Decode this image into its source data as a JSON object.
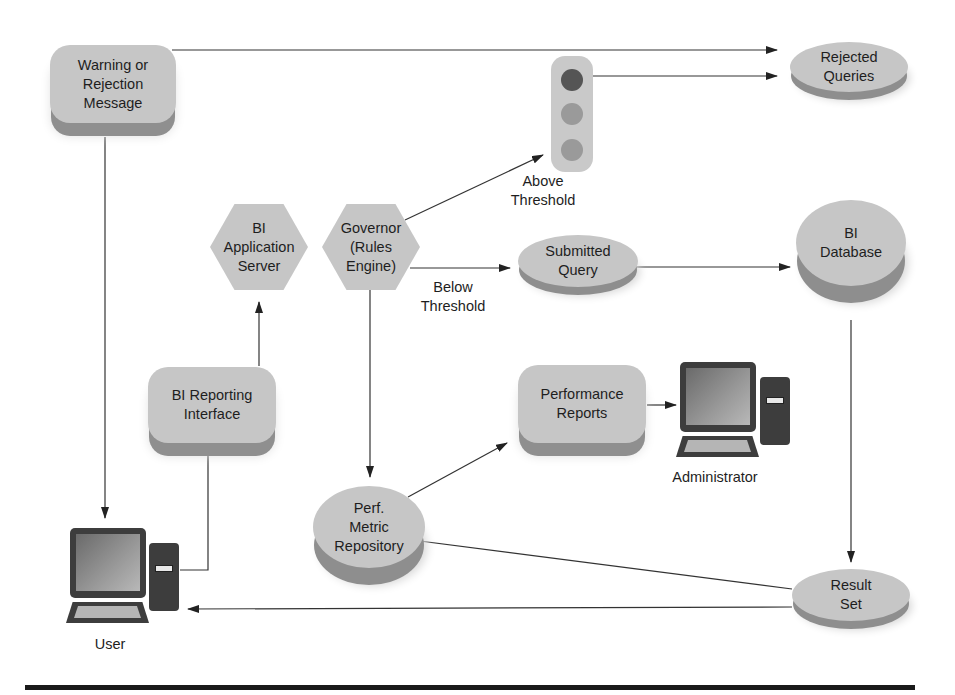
{
  "diagram": {
    "nodes": {
      "warning": {
        "label": "Warning or\nRejection\nMessage",
        "shape": "rounded-box"
      },
      "rejected_queries": {
        "label": "Rejected\nQueries",
        "shape": "disk"
      },
      "traffic_light": {
        "label": "",
        "shape": "traffic-light",
        "colors": [
          "#555555",
          "#9a9a9a",
          "#9a9a9a"
        ]
      },
      "bi_app_server": {
        "label": "BI\nApplication\nServer",
        "shape": "hexagon"
      },
      "governor": {
        "label": "Governor\n(Rules\nEngine)",
        "shape": "hexagon"
      },
      "submitted_query": {
        "label": "Submitted\nQuery",
        "shape": "disk"
      },
      "bi_database": {
        "label": "BI\nDatabase",
        "shape": "disk"
      },
      "bi_reporting": {
        "label": "BI Reporting\nInterface",
        "shape": "rounded-box"
      },
      "performance_reports": {
        "label": "Performance\nReports",
        "shape": "rounded-box"
      },
      "administrator": {
        "label": "Administrator",
        "shape": "computer"
      },
      "perf_repo": {
        "label": "Perf.\nMetric\nRepository",
        "shape": "disk"
      },
      "result_set": {
        "label": "Result\nSet",
        "shape": "disk"
      },
      "user": {
        "label": "User",
        "shape": "computer"
      }
    },
    "edge_labels": {
      "above": "Above\nThreshold",
      "below": "Below\nThreshold"
    },
    "edges": [
      {
        "from": "warning",
        "to": "rejected_queries"
      },
      {
        "from": "traffic_light",
        "to": "rejected_queries"
      },
      {
        "from": "governor",
        "to": "traffic_light",
        "label": "Above Threshold"
      },
      {
        "from": "governor",
        "to": "submitted_query",
        "label": "Below Threshold"
      },
      {
        "from": "submitted_query",
        "to": "bi_database"
      },
      {
        "from": "bi_database",
        "to": "result_set"
      },
      {
        "from": "result_set",
        "to": "perf_repo"
      },
      {
        "from": "result_set",
        "to": "user"
      },
      {
        "from": "governor",
        "to": "perf_repo"
      },
      {
        "from": "perf_repo",
        "to": "performance_reports"
      },
      {
        "from": "performance_reports",
        "to": "administrator"
      },
      {
        "from": "bi_reporting",
        "to": "bi_app_server"
      },
      {
        "from": "user",
        "to": "bi_reporting"
      },
      {
        "from": "warning",
        "to": "user"
      }
    ],
    "colors": {
      "node_fill": "#c6c6c6",
      "node_shadow": "#8f8f8f",
      "line": "#333333",
      "computer": "#3d3d3d"
    }
  }
}
